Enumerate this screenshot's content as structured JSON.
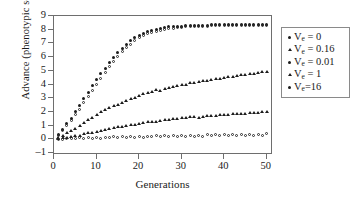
{
  "chart_data": {
    "type": "scatter",
    "title": "",
    "xlabel": "Generations",
    "ylabel": "Advance (phenotypic sd)",
    "xlim": [
      0,
      51
    ],
    "ylim": [
      -1,
      9
    ],
    "xticks": [
      0,
      10,
      20,
      30,
      40,
      50
    ],
    "yticks": [
      -1,
      0,
      1,
      2,
      3,
      4,
      5,
      6,
      7,
      8,
      9
    ],
    "grid": false,
    "legend_position": "right",
    "x": [
      1,
      2,
      3,
      4,
      5,
      6,
      7,
      8,
      9,
      10,
      11,
      12,
      13,
      14,
      15,
      16,
      17,
      18,
      19,
      20,
      21,
      22,
      23,
      24,
      25,
      26,
      27,
      28,
      29,
      30,
      31,
      32,
      33,
      34,
      35,
      36,
      37,
      38,
      39,
      40,
      41,
      42,
      43,
      44,
      45,
      46,
      47,
      48,
      49,
      50
    ],
    "series": [
      {
        "name": "V_e = 0",
        "label": "V",
        "sub": "e",
        "rest": " = 0",
        "marker": "filled-circle",
        "values": [
          0.35,
          0.75,
          1.15,
          1.55,
          2.0,
          2.45,
          2.95,
          3.45,
          3.9,
          4.35,
          4.8,
          5.2,
          5.6,
          6.0,
          6.35,
          6.65,
          6.95,
          7.2,
          7.4,
          7.6,
          7.75,
          7.85,
          7.95,
          8.0,
          8.1,
          8.15,
          8.2,
          8.22,
          8.25,
          8.27,
          8.28,
          8.3,
          8.3,
          8.32,
          8.33,
          8.34,
          8.35,
          8.35,
          8.36,
          8.36,
          8.37,
          8.37,
          8.38,
          8.38,
          8.38,
          8.39,
          8.39,
          8.39,
          8.4,
          8.4
        ]
      },
      {
        "name": "V_e = 0.01",
        "label": "V",
        "sub": "e",
        "rest": " = 0.01",
        "marker": "open-circle",
        "values": [
          0.28,
          0.62,
          1.0,
          1.38,
          1.78,
          2.2,
          2.65,
          3.1,
          3.55,
          4.0,
          4.45,
          4.85,
          5.3,
          5.7,
          6.05,
          6.4,
          6.7,
          6.95,
          7.2,
          7.4,
          7.55,
          7.7,
          7.8,
          7.9,
          7.95,
          8.02,
          8.07,
          8.12,
          8.15,
          8.18,
          8.2,
          8.22,
          8.24,
          8.25,
          8.26,
          8.27,
          8.28,
          8.29,
          8.3,
          8.3,
          8.31,
          8.31,
          8.32,
          8.32,
          8.33,
          8.33,
          8.33,
          8.34,
          8.34,
          8.34
        ]
      },
      {
        "name": "V_e = 0.16",
        "label": "V",
        "sub": "e",
        "rest": " = 0.16",
        "marker": "filled-tri",
        "values": [
          0.15,
          0.3,
          0.45,
          0.6,
          0.8,
          1.0,
          1.2,
          1.4,
          1.6,
          1.8,
          2.0,
          2.15,
          2.3,
          2.45,
          2.55,
          2.7,
          2.85,
          2.95,
          3.05,
          3.2,
          3.3,
          3.4,
          3.5,
          3.6,
          3.55,
          3.7,
          3.8,
          3.85,
          3.9,
          4.0,
          4.0,
          4.1,
          4.15,
          4.2,
          4.25,
          4.3,
          4.35,
          4.4,
          4.45,
          4.5,
          4.55,
          4.6,
          4.62,
          4.68,
          4.72,
          4.78,
          4.82,
          4.86,
          4.9,
          4.95
        ]
      },
      {
        "name": "V_e = 1",
        "label": "V",
        "sub": "e",
        "rest": " = 1",
        "marker": "filled-tri",
        "values": [
          0.05,
          0.1,
          0.15,
          0.2,
          0.25,
          0.3,
          0.38,
          0.45,
          0.5,
          0.58,
          0.65,
          0.7,
          0.78,
          0.85,
          0.9,
          0.95,
          1.0,
          1.05,
          1.1,
          1.15,
          1.2,
          1.25,
          1.28,
          1.3,
          1.35,
          1.4,
          1.45,
          1.5,
          1.48,
          1.55,
          1.58,
          1.62,
          1.65,
          1.6,
          1.68,
          1.72,
          1.75,
          1.72,
          1.78,
          1.8,
          1.82,
          1.85,
          1.88,
          1.9,
          1.88,
          1.92,
          1.95,
          1.97,
          2.0,
          2.02
        ]
      },
      {
        "name": "V_e = 16",
        "label": "V",
        "sub": "e",
        "rest": "=16",
        "marker": "open-circle",
        "values": [
          0.02,
          0.0,
          0.05,
          0.08,
          0.03,
          0.1,
          0.06,
          0.12,
          0.08,
          0.14,
          0.09,
          0.16,
          0.11,
          0.18,
          0.12,
          0.2,
          0.14,
          0.22,
          0.15,
          0.23,
          0.16,
          0.24,
          0.17,
          0.25,
          0.18,
          0.26,
          0.2,
          0.27,
          0.21,
          0.28,
          0.22,
          0.3,
          0.23,
          0.3,
          0.24,
          0.32,
          0.25,
          0.33,
          0.26,
          0.34,
          0.27,
          0.35,
          0.28,
          0.36,
          0.29,
          0.37,
          0.3,
          0.38,
          0.31,
          0.39
        ]
      }
    ]
  },
  "legend": {
    "entries": [
      {
        "marker": "filled-circle",
        "var": "V",
        "sub": "e",
        "rest": " = 0"
      },
      {
        "marker": "filled-tri",
        "var": "V",
        "sub": "e",
        "rest": " = 0.16"
      },
      {
        "marker": "filled-circle",
        "var": "V",
        "sub": "e",
        "rest": " = 0.01"
      },
      {
        "marker": "filled-tri",
        "var": "V",
        "sub": "e",
        "rest": " = 1"
      },
      {
        "marker": "filled-circle",
        "var": "V",
        "sub": "e",
        "rest": "=16"
      }
    ]
  }
}
